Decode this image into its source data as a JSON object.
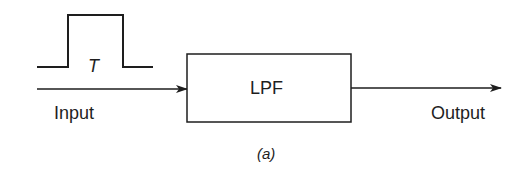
{
  "diagram": {
    "type": "block-diagram",
    "caption": "(a)",
    "input": {
      "label": "Input",
      "pulse_width_label": "T",
      "signal_shape": "rectangular-pulse"
    },
    "block": {
      "label": "LPF"
    },
    "output": {
      "label": "Output"
    },
    "edges": [
      {
        "from": "input",
        "to": "block",
        "arrow": true
      },
      {
        "from": "block",
        "to": "output",
        "arrow": true
      }
    ],
    "colors": {
      "stroke": "#1e1e1e",
      "background": "#ffffff"
    }
  }
}
